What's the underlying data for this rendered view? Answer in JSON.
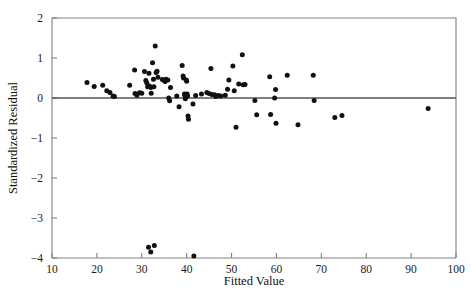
{
  "figure": {
    "type": "residual-scatter-plot",
    "background": "#ffffff",
    "marker_color": "#111111",
    "axis_color": "#808080",
    "zero_line_color": "#555555",
    "caption_clipped": ""
  },
  "chart_data": {
    "type": "scatter",
    "title": "",
    "xlabel": "Fitted Value",
    "ylabel": "Standardized Residual",
    "xlim": [
      10,
      100
    ],
    "ylim": [
      -4,
      2
    ],
    "xticks": [
      10,
      20,
      30,
      40,
      50,
      60,
      70,
      80,
      90,
      100
    ],
    "yticks": [
      2,
      1,
      0,
      -1,
      -2,
      -3,
      -4
    ],
    "xtick_labels": [
      "10",
      "20",
      "30",
      "40",
      "50",
      "60",
      "70",
      "80",
      "90",
      "100"
    ],
    "ytick_labels": [
      "2",
      "1",
      "0",
      "−1",
      "−2",
      "−3",
      "−4"
    ],
    "grid": false,
    "legend": null,
    "reference_lines": [
      {
        "name": "zero-residual-line",
        "orientation": "horizontal",
        "y": 0
      }
    ],
    "series": [
      {
        "name": "standardized residuals",
        "marker": "filled-circle",
        "color": "#111111",
        "points": [
          [
            17.8,
            0.39
          ],
          [
            19.4,
            0.29
          ],
          [
            21.3,
            0.32
          ],
          [
            22.2,
            0.18
          ],
          [
            22.9,
            0.14
          ],
          [
            23.6,
            0.05
          ],
          [
            23.9,
            0.04
          ],
          [
            27.3,
            0.32
          ],
          [
            28.4,
            0.7
          ],
          [
            28.5,
            0.11
          ],
          [
            28.9,
            0.07
          ],
          [
            29.5,
            0.13
          ],
          [
            30.0,
            0.12
          ],
          [
            30.6,
            0.66
          ],
          [
            30.9,
            0.44
          ],
          [
            31.1,
            0.38
          ],
          [
            31.3,
            0.28
          ],
          [
            31.6,
            0.62
          ],
          [
            31.7,
            0.3
          ],
          [
            32.0,
            0.26
          ],
          [
            32.1,
            0.12
          ],
          [
            32.4,
            0.88
          ],
          [
            32.6,
            0.47
          ],
          [
            32.7,
            0.28
          ],
          [
            33.0,
            1.3
          ],
          [
            33.2,
            0.64
          ],
          [
            33.4,
            0.67
          ],
          [
            33.6,
            0.52
          ],
          [
            34.6,
            0.46
          ],
          [
            35.0,
            0.44
          ],
          [
            35.2,
            0.41
          ],
          [
            35.4,
            0.47
          ],
          [
            35.8,
            0.45
          ],
          [
            36.0,
            0.0
          ],
          [
            36.2,
            -0.07
          ],
          [
            36.4,
            0.26
          ],
          [
            37.8,
            0.05
          ],
          [
            38.3,
            -0.22
          ],
          [
            39.0,
            0.81
          ],
          [
            39.2,
            0.55
          ],
          [
            39.3,
            0.5
          ],
          [
            39.5,
            0.1
          ],
          [
            39.6,
            0.06
          ],
          [
            39.7,
            -0.02
          ],
          [
            39.8,
            0.02
          ],
          [
            39.9,
            0.45
          ],
          [
            40.0,
            0.42
          ],
          [
            40.1,
            0.1
          ],
          [
            40.2,
            0.05
          ],
          [
            40.3,
            -0.45
          ],
          [
            40.4,
            -0.53
          ],
          [
            41.4,
            -0.15
          ],
          [
            42.0,
            0.06
          ],
          [
            43.3,
            0.1
          ],
          [
            44.5,
            0.14
          ],
          [
            45.0,
            0.11
          ],
          [
            45.4,
            0.74
          ],
          [
            45.6,
            0.09
          ],
          [
            46.2,
            0.08
          ],
          [
            46.5,
            0.04
          ],
          [
            47.0,
            0.06
          ],
          [
            47.6,
            0.05
          ],
          [
            48.6,
            0.07
          ],
          [
            49.1,
            0.22
          ],
          [
            49.4,
            0.45
          ],
          [
            50.3,
            0.8
          ],
          [
            50.6,
            0.18
          ],
          [
            51.0,
            -0.73
          ],
          [
            51.6,
            0.35
          ],
          [
            52.4,
            1.08
          ],
          [
            52.6,
            0.33
          ],
          [
            53.0,
            0.34
          ],
          [
            55.2,
            -0.06
          ],
          [
            55.6,
            -0.42
          ],
          [
            58.5,
            0.53
          ],
          [
            58.7,
            -0.41
          ],
          [
            59.6,
            0.0
          ],
          [
            59.8,
            0.21
          ],
          [
            59.9,
            -0.63
          ],
          [
            62.4,
            0.57
          ],
          [
            64.8,
            -0.67
          ],
          [
            68.2,
            0.57
          ],
          [
            68.4,
            -0.06
          ],
          [
            73.0,
            -0.49
          ],
          [
            74.6,
            -0.44
          ],
          [
            93.8,
            -0.26
          ],
          [
            31.5,
            -3.73
          ],
          [
            32.8,
            -3.69
          ],
          [
            32.0,
            -3.85
          ],
          [
            41.6,
            -3.95
          ]
        ]
      }
    ]
  }
}
